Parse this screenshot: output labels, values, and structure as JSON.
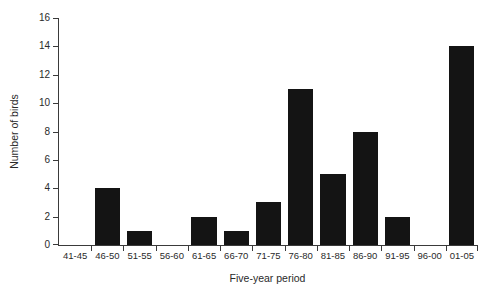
{
  "page": {
    "background_color": "#ffffff",
    "text_color": "#2a2a2a"
  },
  "chart_data": {
    "type": "bar",
    "title": "",
    "categories": [
      "41-45",
      "46-50",
      "51-55",
      "56-60",
      "61-65",
      "66-70",
      "71-75",
      "76-80",
      "81-85",
      "86-90",
      "91-95",
      "96-00",
      "01-05"
    ],
    "values": [
      0,
      4,
      1,
      0,
      2,
      1,
      3,
      11,
      5,
      8,
      2,
      0,
      14
    ],
    "xlabel": "Five-year period",
    "ylabel": "Number of birds",
    "ylim": [
      0,
      16
    ],
    "ytick_step": 2,
    "ytick_labels": [
      "0",
      "2",
      "4",
      "6",
      "8",
      "10",
      "12",
      "14",
      "16"
    ],
    "bar_color": "#141414",
    "axis_color": "#3a3a3a",
    "grid": false,
    "legend": false,
    "bar_width_fraction": 0.78
  }
}
